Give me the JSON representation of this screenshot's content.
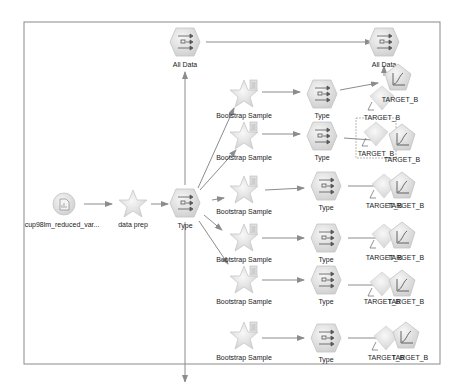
{
  "colors": {
    "frame": "#8a8a8a",
    "link": "#8c8c8c",
    "node_fill": "#e2e2e2",
    "node_stroke": "#bdbdbd",
    "star_fill": "#e6e6e6",
    "label": "#222222"
  },
  "source_node": {
    "label": "cup98lm_reduced_var...",
    "icon": "database-file-icon"
  },
  "data_prep_node": {
    "label": "data prep",
    "icon": "star-supernode-icon"
  },
  "main_type_node": {
    "label": "Type",
    "icon": "type-node-icon"
  },
  "all_data_left": {
    "label": "All Data",
    "icon": "type-node-icon"
  },
  "all_data_right": {
    "label": "All Data",
    "icon": "type-node-icon"
  },
  "branches": [
    {
      "sample_label": "Bootstrap Sample",
      "type_label": "Type",
      "model_label": "TARGET_B",
      "nugget_label": "TARGET_B"
    },
    {
      "sample_label": "Bootstrap Sample",
      "type_label": "Type",
      "model_label": "TARGET_B",
      "nugget_label": "TARGET_B"
    },
    {
      "sample_label": "Bootstrap Sample",
      "type_label": "Type",
      "model_label": "TARGET_B",
      "nugget_label": "TARGET_B"
    },
    {
      "sample_label": "Bootstrap Sample",
      "type_label": "Type",
      "model_label": "TARGET_B",
      "nugget_label": "TARGET_B"
    },
    {
      "sample_label": "Bootstrap Sample",
      "type_label": "Type",
      "model_label": "TARGET_B",
      "nugget_label": "TARGET_B"
    },
    {
      "sample_label": "Bootstrap Sample",
      "type_label": "Type",
      "model_label": "TARGET_B",
      "nugget_label": "TARGET_B"
    }
  ],
  "extra_labels": {
    "top_model": "TARGET_B",
    "top_nugget": "TARGET_B"
  }
}
